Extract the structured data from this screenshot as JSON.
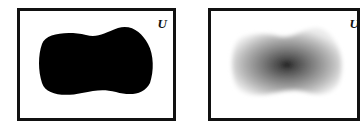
{
  "diagram": {
    "panels": [
      {
        "id": "crisp-set",
        "universe_label": "U",
        "fill": "#000000",
        "description": "solid black blob (crisp set)"
      },
      {
        "id": "fuzzy-set",
        "universe_label": "U",
        "fill_center": "#111111",
        "fill_edge": "#ffffff",
        "description": "gradient gray blob (fuzzy set), darkest at center"
      }
    ]
  }
}
